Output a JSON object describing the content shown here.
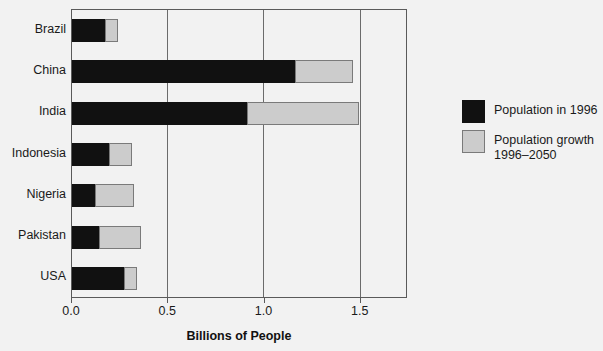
{
  "chart_data": {
    "type": "bar",
    "orientation": "horizontal",
    "title": "",
    "xlabel": "Billions of People",
    "ylabel": "",
    "xlim": [
      0.0,
      1.745
    ],
    "xticks": [
      0.0,
      0.5,
      1.0,
      1.5
    ],
    "xticklabels": [
      "0.0",
      "0.5",
      "1.0",
      "1.5"
    ],
    "grid": true,
    "grid_axis": "x",
    "stacked": true,
    "legend_position": "right",
    "categories": [
      "Brazil",
      "China",
      "India",
      "Indonesia",
      "Nigeria",
      "Pakistan",
      "USA"
    ],
    "series": [
      {
        "name": "Population in 1996",
        "color": "#111111",
        "values": [
          0.17,
          1.16,
          0.91,
          0.19,
          0.12,
          0.14,
          0.27
        ]
      },
      {
        "name": "Population growth 1996–2050",
        "color": "#cccccc",
        "values": [
          0.07,
          0.3,
          0.58,
          0.12,
          0.2,
          0.22,
          0.07
        ]
      }
    ],
    "totals": [
      0.24,
      1.46,
      1.49,
      0.31,
      0.32,
      0.36,
      0.34
    ]
  },
  "axis": {
    "x_title": "Billions of People",
    "ticks": [
      {
        "value": 0.0,
        "label": "0.0"
      },
      {
        "value": 0.5,
        "label": "0.5"
      },
      {
        "value": 1.0,
        "label": "1.0"
      },
      {
        "value": 1.5,
        "label": "1.5"
      }
    ]
  },
  "categories": [
    {
      "label": "Brazil"
    },
    {
      "label": "China"
    },
    {
      "label": "India"
    },
    {
      "label": "Indonesia"
    },
    {
      "label": "Nigeria"
    },
    {
      "label": "Pakistan"
    },
    {
      "label": "USA"
    }
  ],
  "legend": {
    "items": [
      {
        "label": "Population in 1996",
        "color": "#111111"
      },
      {
        "label": "Population growth\n1996–2050",
        "color": "#cccccc"
      }
    ]
  },
  "colors": {
    "background": "#f2f2f2",
    "frame": "#5a5a5a",
    "gridline": "#6b6b6b",
    "series_1996": "#111111",
    "series_growth": "#cccccc",
    "text": "#1a1a1a"
  }
}
